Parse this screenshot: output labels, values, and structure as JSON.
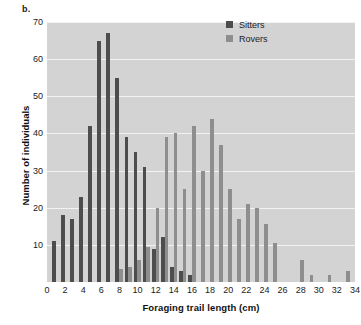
{
  "panel_label": "b.",
  "legend": {
    "position": "top-right",
    "entries": [
      {
        "label": "Sitters",
        "color": "#4d4d4d"
      },
      {
        "label": "Rovers",
        "color": "#8e8e8e"
      }
    ]
  },
  "chart_data": {
    "type": "bar",
    "title": "",
    "subtitle": "",
    "xlabel": "Foraging trail length (cm)",
    "ylabel": "Number of individuals",
    "xlim": [
      0,
      34
    ],
    "ylim": [
      0,
      70
    ],
    "grid": true,
    "xtick_labels": [
      "0",
      "2",
      "4",
      "6",
      "8",
      "10",
      "12",
      "14",
      "16",
      "18",
      "20",
      "22",
      "24",
      "26",
      "28",
      "30",
      "32",
      "34"
    ],
    "xtick_values": [
      0,
      2,
      4,
      6,
      8,
      10,
      12,
      14,
      16,
      18,
      20,
      22,
      24,
      26,
      28,
      30,
      32,
      34
    ],
    "ytick_labels": [
      "10",
      "20",
      "30",
      "40",
      "50",
      "60",
      "70"
    ],
    "ytick_values": [
      10,
      20,
      30,
      40,
      50,
      60,
      70
    ],
    "x": [
      1,
      2,
      3,
      4,
      5,
      6,
      7,
      8,
      9,
      10,
      11,
      12,
      13,
      14,
      15,
      16,
      17,
      18,
      19,
      20,
      21,
      22,
      23,
      24,
      25,
      28,
      29,
      31,
      33
    ],
    "series": [
      {
        "name": "Sitters",
        "color": "#4d4d4d",
        "values": [
          11,
          18,
          17,
          23,
          42,
          65,
          67,
          55,
          39,
          35,
          31,
          9,
          12,
          4,
          3,
          2,
          0,
          0,
          0,
          0,
          0,
          0,
          0,
          0,
          0,
          0,
          0,
          0,
          0
        ]
      },
      {
        "name": "Rovers",
        "color": "#8e8e8e",
        "values": [
          0,
          0,
          0,
          0,
          0,
          0,
          0,
          3.5,
          4,
          6,
          9.5,
          20,
          39,
          40,
          25,
          42,
          30,
          44,
          37,
          25,
          17,
          21,
          20,
          15.5,
          10.5,
          6,
          2,
          2,
          3
        ]
      }
    ]
  }
}
